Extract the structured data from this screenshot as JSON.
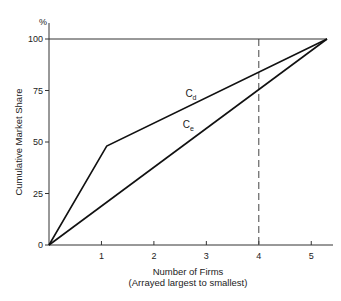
{
  "chart_data": {
    "type": "line",
    "title": "",
    "xlabel": "Number of Firms",
    "xlabel_sub": "(Arrayed largest to smallest)",
    "ylabel": "Cumulative Market Share",
    "y_unit_label": "%",
    "xlim": [
      0,
      5.3
    ],
    "ylim": [
      0,
      100
    ],
    "x_ticks": [
      1,
      2,
      3,
      4,
      5
    ],
    "y_ticks": [
      0,
      25,
      50,
      75,
      100
    ],
    "grid": false,
    "legend": "none",
    "series": [
      {
        "name": "Cd",
        "label_main": "C",
        "label_sub": "d",
        "x": [
          0,
          1.1,
          5.3
        ],
        "y": [
          0,
          48,
          100
        ]
      },
      {
        "name": "Ce",
        "label_main": "C",
        "label_sub": "e",
        "x": [
          0,
          5.3
        ],
        "y": [
          0,
          100
        ]
      }
    ],
    "reference_lines": [
      {
        "orientation": "horizontal",
        "y": 100,
        "style": "solid"
      },
      {
        "orientation": "vertical",
        "x": 4,
        "style": "dashed"
      }
    ]
  }
}
